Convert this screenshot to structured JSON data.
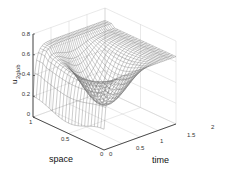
{
  "chart_data": {
    "type": "surface",
    "title": "",
    "xlabel": "time",
    "ylabel": "space",
    "zlabel": "u_2glob",
    "zlabel_main": "u",
    "zlabel_sub": "2glob",
    "xlim": [
      0,
      2
    ],
    "ylim": [
      0,
      1
    ],
    "zlim": [
      0,
      0.8
    ],
    "x_ticks": [
      "0",
      "0.5",
      "1",
      "1.5",
      "2"
    ],
    "y_ticks": [
      "0",
      "0.5",
      "1"
    ],
    "z_ticks": [
      "0",
      "0.2",
      "0.4",
      "0.6",
      "0.8"
    ],
    "grid": true,
    "style": "mesh wireframe (gray lines on white)"
  },
  "colors": {
    "mesh": "#6f6f6f",
    "grid": "#c8c8c8",
    "axis": "#222222"
  }
}
